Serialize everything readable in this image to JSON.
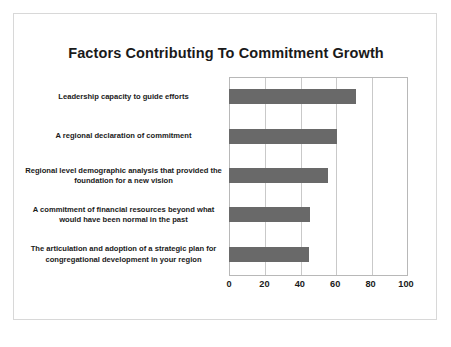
{
  "slide": {
    "title": "Factors Contributing To Commitment Growth"
  },
  "colors": {
    "bar": "#696969",
    "gridline": "#c9c9c9",
    "plot_border": "#b8b8b8",
    "frame_border": "#d8d8d8",
    "background": "#ffffff",
    "text": "#1a1a1a"
  },
  "chart_data": {
    "type": "bar",
    "orientation": "horizontal",
    "title": "Factors Contributing To Commitment Growth",
    "xlabel": "",
    "ylabel": "",
    "xlim": [
      0,
      100
    ],
    "grid": true,
    "legend": false,
    "xticks": [
      "0",
      "20",
      "40",
      "60",
      "80",
      "100"
    ],
    "xtick_values": [
      0,
      20,
      40,
      60,
      80,
      100
    ],
    "categories": [
      "Leadership capacity to guide efforts",
      "A regional declaration of commitment",
      "Regional level demographic analysis that provided  the foundation for a new vision",
      "A commitment of financial resources beyond what would have been normal in the past",
      "The articulation and adoption of a strategic plan for congregational development in your region"
    ],
    "values": [
      72,
      61,
      56,
      46,
      45
    ],
    "bars": [
      {
        "label": "Leadership capacity to guide efforts",
        "value": 72
      },
      {
        "label": "A regional declaration of commitment",
        "value": 61
      },
      {
        "label": "Regional level demographic analysis that provided  the foundation for a new vision",
        "value": 56
      },
      {
        "label": "A commitment of financial resources beyond what would have been normal in the past",
        "value": 46
      },
      {
        "label": "The articulation and adoption of a strategic plan for congregational development in your region",
        "value": 45
      }
    ]
  }
}
